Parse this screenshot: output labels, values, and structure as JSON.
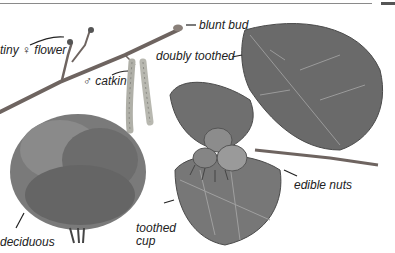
{
  "labels": {
    "tiny_flower": "tiny ♀ flower",
    "blunt_bud": "blunt bud",
    "doubly_toothed": "doubly toothed",
    "catkin": "♂ catkin",
    "deciduous": "deciduous",
    "toothed_cup_line1": "toothed",
    "toothed_cup_line2": "cup",
    "edible_nuts": "edible nuts"
  },
  "colors": {
    "text": "#222222",
    "leader_line": "#222222",
    "leaf_dark": "#5c5c5c",
    "leaf_mid": "#7a7a7a",
    "leaf_light": "#a0a0a0",
    "twig": "#6e6460",
    "catkin": "#b8b8b0",
    "tree": "#6f6f6f"
  }
}
